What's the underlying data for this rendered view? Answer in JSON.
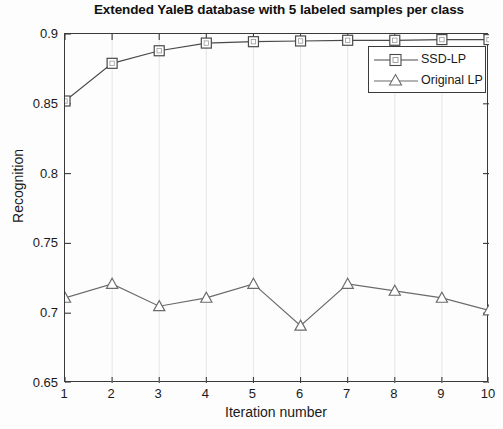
{
  "chart_data": {
    "type": "line",
    "title": "Extended YaleB database with 5 labeled samples per class",
    "xlabel": "Iteration number",
    "ylabel": "Recognition",
    "x": [
      1,
      2,
      3,
      4,
      5,
      6,
      7,
      8,
      9,
      10
    ],
    "xlim": [
      1,
      10
    ],
    "ylim": [
      0.65,
      0.9
    ],
    "xticks": [
      "1",
      "2",
      "3",
      "4",
      "5",
      "6",
      "7",
      "8",
      "9",
      "10"
    ],
    "yticks": [
      "0.65",
      "0.7",
      "0.75",
      "0.8",
      "0.85",
      "0.9"
    ],
    "ytick_values": [
      0.65,
      0.7,
      0.75,
      0.8,
      0.85,
      0.9
    ],
    "grid": false,
    "legend_position": "upper right",
    "series": [
      {
        "name": "SSD-LP",
        "marker": "square",
        "color": "#4a4a4a",
        "values": [
          0.852,
          0.879,
          0.888,
          0.8935,
          0.8945,
          0.895,
          0.8955,
          0.8955,
          0.896,
          0.896
        ]
      },
      {
        "name": "Original LP",
        "marker": "triangle",
        "color": "#6b6b6b",
        "values": [
          0.711,
          0.721,
          0.705,
          0.711,
          0.721,
          0.691,
          0.721,
          0.716,
          0.711,
          0.702
        ]
      }
    ]
  },
  "legend": {
    "items": [
      {
        "label": "SSD-LP"
      },
      {
        "label": "Original LP"
      }
    ]
  },
  "colors": {
    "axis": "#3a3a3a",
    "series_1": "#4a4a4a",
    "series_2": "#6b6b6b",
    "background": "#fdfdfd"
  }
}
